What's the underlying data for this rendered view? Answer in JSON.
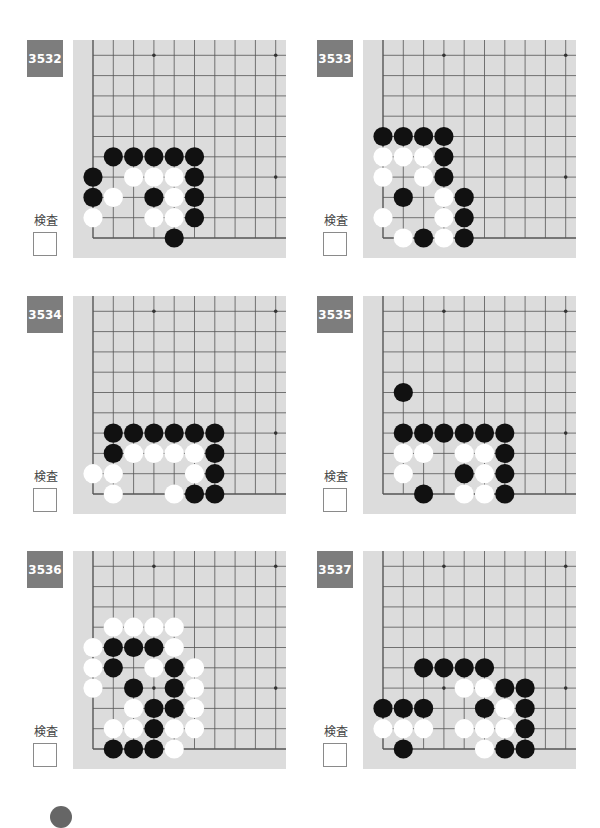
{
  "page": {
    "check_label": "検査",
    "colors": {
      "board": "#dcdcdc",
      "grid_line": "#555555",
      "label_bg": "#7d7d7d",
      "black_stone": "#111111",
      "white_stone": "#ffffff"
    }
  },
  "puzzles": [
    {
      "number": "3532",
      "black": [
        [
          1,
          4
        ],
        [
          2,
          4
        ],
        [
          3,
          4
        ],
        [
          4,
          4
        ],
        [
          5,
          4
        ],
        [
          0,
          3
        ],
        [
          5,
          3
        ],
        [
          0,
          2
        ],
        [
          3,
          2
        ],
        [
          5,
          2
        ],
        [
          5,
          1
        ],
        [
          4,
          0
        ]
      ],
      "white": [
        [
          2,
          3
        ],
        [
          3,
          3
        ],
        [
          4,
          3
        ],
        [
          1,
          2
        ],
        [
          4,
          2
        ],
        [
          0,
          1
        ],
        [
          3,
          1
        ],
        [
          4,
          1
        ]
      ]
    },
    {
      "number": "3533",
      "black": [
        [
          0,
          5
        ],
        [
          1,
          5
        ],
        [
          2,
          5
        ],
        [
          3,
          5
        ],
        [
          3,
          4
        ],
        [
          3,
          3
        ],
        [
          1,
          2
        ],
        [
          4,
          2
        ],
        [
          4,
          1
        ],
        [
          2,
          0
        ],
        [
          4,
          0
        ]
      ],
      "white": [
        [
          0,
          4
        ],
        [
          1,
          4
        ],
        [
          2,
          4
        ],
        [
          0,
          3
        ],
        [
          2,
          3
        ],
        [
          3,
          2
        ],
        [
          0,
          1
        ],
        [
          3,
          1
        ],
        [
          1,
          0
        ],
        [
          3,
          0
        ]
      ]
    },
    {
      "number": "3534",
      "black": [
        [
          1,
          3
        ],
        [
          2,
          3
        ],
        [
          3,
          3
        ],
        [
          4,
          3
        ],
        [
          5,
          3
        ],
        [
          6,
          3
        ],
        [
          1,
          2
        ],
        [
          6,
          2
        ],
        [
          6,
          1
        ],
        [
          5,
          0
        ],
        [
          6,
          0
        ]
      ],
      "white": [
        [
          2,
          2
        ],
        [
          3,
          2
        ],
        [
          4,
          2
        ],
        [
          5,
          2
        ],
        [
          0,
          1
        ],
        [
          1,
          1
        ],
        [
          5,
          1
        ],
        [
          1,
          0
        ],
        [
          4,
          0
        ]
      ]
    },
    {
      "number": "3535",
      "black": [
        [
          1,
          5
        ],
        [
          1,
          3
        ],
        [
          2,
          3
        ],
        [
          3,
          3
        ],
        [
          4,
          3
        ],
        [
          5,
          3
        ],
        [
          6,
          3
        ],
        [
          6,
          2
        ],
        [
          4,
          1
        ],
        [
          6,
          1
        ],
        [
          2,
          0
        ],
        [
          6,
          0
        ]
      ],
      "white": [
        [
          1,
          2
        ],
        [
          2,
          2
        ],
        [
          4,
          2
        ],
        [
          5,
          2
        ],
        [
          1,
          1
        ],
        [
          5,
          1
        ],
        [
          4,
          0
        ],
        [
          5,
          0
        ]
      ]
    },
    {
      "number": "3536",
      "black": [
        [
          1,
          5
        ],
        [
          2,
          5
        ],
        [
          3,
          5
        ],
        [
          1,
          4
        ],
        [
          4,
          4
        ],
        [
          2,
          3
        ],
        [
          4,
          3
        ],
        [
          3,
          2
        ],
        [
          4,
          2
        ],
        [
          3,
          1
        ],
        [
          1,
          0
        ],
        [
          2,
          0
        ],
        [
          3,
          0
        ]
      ],
      "white": [
        [
          1,
          6
        ],
        [
          2,
          6
        ],
        [
          3,
          6
        ],
        [
          4,
          6
        ],
        [
          0,
          5
        ],
        [
          4,
          5
        ],
        [
          0,
          4
        ],
        [
          3,
          4
        ],
        [
          5,
          4
        ],
        [
          0,
          3
        ],
        [
          5,
          3
        ],
        [
          2,
          2
        ],
        [
          5,
          2
        ],
        [
          1,
          1
        ],
        [
          2,
          1
        ],
        [
          4,
          1
        ],
        [
          5,
          1
        ],
        [
          4,
          0
        ]
      ]
    },
    {
      "number": "3537",
      "black": [
        [
          2,
          4
        ],
        [
          3,
          4
        ],
        [
          4,
          4
        ],
        [
          5,
          4
        ],
        [
          6,
          3
        ],
        [
          7,
          3
        ],
        [
          0,
          2
        ],
        [
          1,
          2
        ],
        [
          2,
          2
        ],
        [
          5,
          2
        ],
        [
          7,
          2
        ],
        [
          7,
          1
        ],
        [
          1,
          0
        ],
        [
          6,
          0
        ],
        [
          7,
          0
        ]
      ],
      "white": [
        [
          4,
          3
        ],
        [
          5,
          3
        ],
        [
          6,
          2
        ],
        [
          0,
          1
        ],
        [
          1,
          1
        ],
        [
          2,
          1
        ],
        [
          4,
          1
        ],
        [
          5,
          1
        ],
        [
          6,
          1
        ],
        [
          5,
          0
        ]
      ]
    }
  ]
}
